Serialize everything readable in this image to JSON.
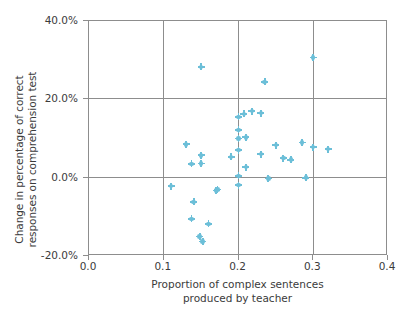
{
  "chart_data": {
    "type": "scatter",
    "title": "",
    "xlabel": "Proportion of complex sentences produced by teacher",
    "xlabel_lines": [
      "Proportion of complex sentences",
      "produced by teacher"
    ],
    "ylabel": "Change in percentage of correct responses on comprehension test",
    "ylabel_lines": [
      "Change in percentage of correct",
      "responses on comprehension test"
    ],
    "xlim": [
      0.0,
      0.4
    ],
    "ylim": [
      -0.2,
      0.4
    ],
    "xticks": [
      0.0,
      0.1,
      0.2,
      0.3,
      0.4
    ],
    "xticklabels": [
      "0.0",
      "0.1",
      "0.2",
      "0.3",
      "0.4"
    ],
    "yticks": [
      -0.2,
      0.0,
      0.2,
      0.4
    ],
    "yticklabels": [
      "-20.0%",
      "0.0%",
      "20.0%",
      "40.0%"
    ],
    "grid": true,
    "grid_color": "#8d8d8d",
    "marker_color": "#6cbfd8",
    "marker": "circle-plus",
    "legend": null,
    "points": [
      {
        "x": 0.11,
        "y": -0.022
      },
      {
        "x": 0.13,
        "y": 0.085
      },
      {
        "x": 0.137,
        "y": 0.035
      },
      {
        "x": 0.14,
        "y": -0.062
      },
      {
        "x": 0.137,
        "y": -0.105
      },
      {
        "x": 0.148,
        "y": -0.15
      },
      {
        "x": 0.15,
        "y": 0.283
      },
      {
        "x": 0.15,
        "y": 0.057
      },
      {
        "x": 0.15,
        "y": 0.036
      },
      {
        "x": 0.152,
        "y": -0.163
      },
      {
        "x": 0.16,
        "y": -0.118
      },
      {
        "x": 0.17,
        "y": -0.033
      },
      {
        "x": 0.172,
        "y": -0.03
      },
      {
        "x": 0.19,
        "y": 0.053
      },
      {
        "x": 0.2,
        "y": 0.155
      },
      {
        "x": 0.2,
        "y": 0.122
      },
      {
        "x": 0.2,
        "y": 0.1
      },
      {
        "x": 0.2,
        "y": 0.07
      },
      {
        "x": 0.2,
        "y": 0.005
      },
      {
        "x": 0.2,
        "y": -0.019
      },
      {
        "x": 0.207,
        "y": 0.163
      },
      {
        "x": 0.21,
        "y": 0.103
      },
      {
        "x": 0.21,
        "y": 0.027
      },
      {
        "x": 0.218,
        "y": 0.17
      },
      {
        "x": 0.23,
        "y": 0.165
      },
      {
        "x": 0.23,
        "y": 0.06
      },
      {
        "x": 0.235,
        "y": 0.245
      },
      {
        "x": 0.24,
        "y": -0.002
      },
      {
        "x": 0.25,
        "y": 0.083
      },
      {
        "x": 0.26,
        "y": 0.05
      },
      {
        "x": 0.27,
        "y": 0.046
      },
      {
        "x": 0.285,
        "y": 0.09
      },
      {
        "x": 0.29,
        "y": 0.0
      },
      {
        "x": 0.3,
        "y": 0.307
      },
      {
        "x": 0.3,
        "y": 0.078
      },
      {
        "x": 0.32,
        "y": 0.073
      }
    ]
  }
}
